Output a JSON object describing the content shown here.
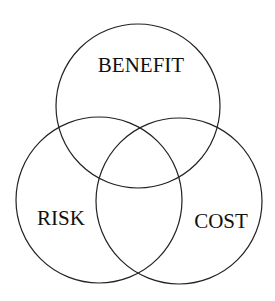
{
  "diagram": {
    "type": "venn",
    "sets": [
      {
        "id": "benefit",
        "label": "BENEFIT",
        "cx": 138,
        "cy": 106,
        "r": 82,
        "label_x": 141,
        "label_y": 72
      },
      {
        "id": "risk",
        "label": "RISK",
        "cx": 99,
        "cy": 200,
        "r": 83,
        "label_x": 61,
        "label_y": 225
      },
      {
        "id": "cost",
        "label": "COST",
        "cx": 179,
        "cy": 201,
        "r": 83,
        "label_x": 221,
        "label_y": 228
      }
    ],
    "stroke_color": "#222222",
    "text_color": "#111111",
    "background": "#ffffff"
  }
}
